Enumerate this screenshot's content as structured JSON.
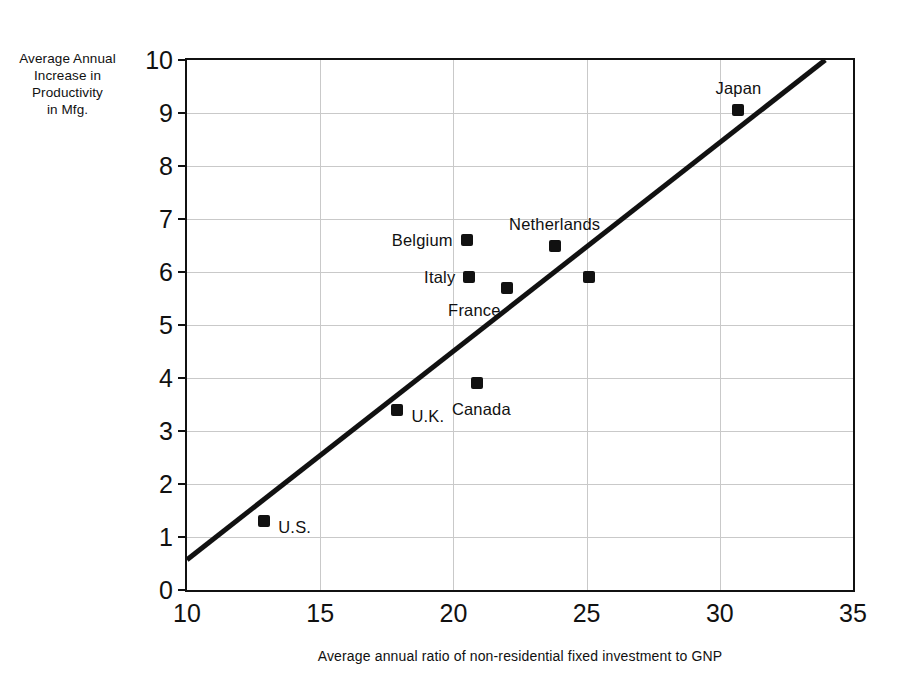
{
  "chart_data": {
    "type": "scatter",
    "title": "",
    "xlabel": "Average annual ratio of non-residential fixed investment to GNP",
    "ylabel_lines": [
      "Average Annual",
      "Increase in",
      "Productivity",
      "in Mfg."
    ],
    "xlim": [
      10,
      35
    ],
    "ylim": [
      0,
      10
    ],
    "xticks": [
      10,
      15,
      20,
      25,
      30,
      35
    ],
    "xtick_labels": [
      "10",
      "15",
      "20",
      "25",
      "30",
      "35"
    ],
    "yticks": [
      0,
      1,
      2,
      3,
      4,
      5,
      6,
      7,
      8,
      9,
      10
    ],
    "ytick_labels": [
      "0",
      "1",
      "2",
      "3",
      "4",
      "5",
      "6",
      "7",
      "8",
      "9",
      "10"
    ],
    "grid": true,
    "grid_color": "#c9c9c9",
    "legend": "none",
    "marker_color": "#111111",
    "line_color": "#111111",
    "points": [
      {
        "label": "U.S.",
        "x": 12.9,
        "y": 1.3,
        "label_pos": "right"
      },
      {
        "label": "U.K.",
        "x": 17.9,
        "y": 3.4,
        "label_pos": "right"
      },
      {
        "label": "Belgium",
        "x": 20.5,
        "y": 6.6,
        "label_pos": "left"
      },
      {
        "label": "Italy",
        "x": 20.6,
        "y": 5.9,
        "label_pos": "left"
      },
      {
        "label": "Canada",
        "x": 20.9,
        "y": 3.9,
        "label_pos": "below"
      },
      {
        "label": "France",
        "x": 22.0,
        "y": 5.7,
        "label_pos": "below-left"
      },
      {
        "label": "Netherlands",
        "x": 23.8,
        "y": 6.5,
        "label_pos": "above"
      },
      {
        "label": "",
        "x": 25.1,
        "y": 5.9,
        "label_pos": "none"
      },
      {
        "label": "Japan",
        "x": 30.7,
        "y": 9.05,
        "label_pos": "above"
      }
    ],
    "trend_line": {
      "x0": 10.0,
      "y0": 0.5,
      "x1": 34.1,
      "y1": 10.0,
      "width_px": 5
    }
  }
}
